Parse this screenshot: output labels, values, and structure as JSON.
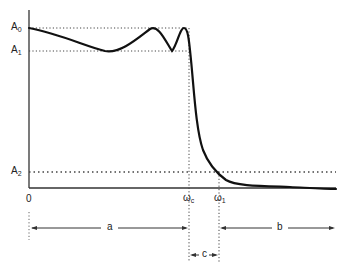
{
  "diagram": {
    "type": "lowpass-filter-magnitude-response",
    "y_labels": {
      "a0": {
        "base": "A",
        "sub": "0"
      },
      "a1": {
        "base": "A",
        "sub": "1"
      },
      "a2": {
        "base": "A",
        "sub": "2"
      }
    },
    "x_labels": {
      "origin": "0",
      "wc": {
        "base": "ω",
        "sub": "c"
      },
      "w1": {
        "base": "ω",
        "sub": "1"
      }
    },
    "bands": {
      "a": "a",
      "b": "b",
      "c": "c"
    },
    "colors": {
      "curve": "#111111",
      "axis": "#333333",
      "dotted": "#444444",
      "background": "#ffffff"
    }
  }
}
